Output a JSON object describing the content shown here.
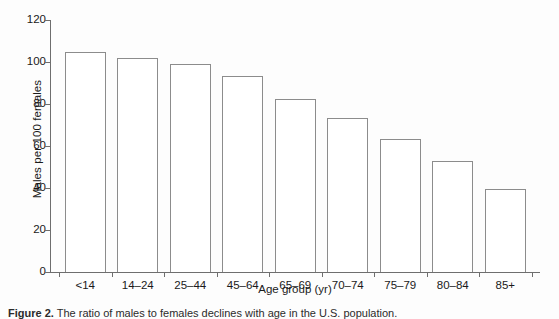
{
  "chart_data": {
    "type": "bar",
    "title": "",
    "xlabel": "Age group (yr)",
    "ylabel": "Males per 100 females",
    "categories": [
      "<14",
      "14–24",
      "25–44",
      "45–64",
      "65–69",
      "70–74",
      "75–79",
      "80–84",
      "85+"
    ],
    "values": [
      105,
      102,
      99,
      93.5,
      82.5,
      73.5,
      63.5,
      53,
      39.5
    ],
    "ylim": [
      0,
      120
    ],
    "yticks": [
      0,
      20,
      40,
      60,
      80,
      100,
      120
    ],
    "ytick_labels": [
      "0",
      "20",
      "40",
      "60",
      "80",
      "100",
      "120"
    ],
    "grid": false,
    "legend": null,
    "bar_style": {
      "fill": "#ffffff",
      "edge": "#8c8c8c"
    }
  },
  "axes": {
    "spine_color": "#6e6e6e"
  },
  "caption": {
    "label": "Figure 2.",
    "text": "The ratio of males to females declines with age in the U.S. population."
  }
}
